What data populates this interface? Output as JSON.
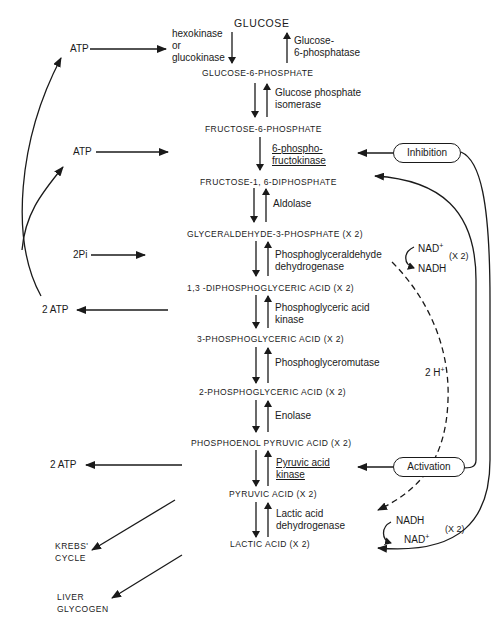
{
  "compounds": [
    {
      "id": "glucose",
      "label": "GLUCOSE"
    },
    {
      "id": "g6p",
      "label": "GLUCOSE-6-PHOSPHATE"
    },
    {
      "id": "f6p",
      "label": "FRUCTOSE-6-PHOSPHATE"
    },
    {
      "id": "f16dp",
      "label": "FRUCTOSE-1, 6-DIPHOSPHATE"
    },
    {
      "id": "g3p",
      "label": "GLYCERALDEHYDE-3-PHOSPHATE  (X 2)"
    },
    {
      "id": "dpga",
      "label": "1,3 -DIPHOSPHOGLYCERIC ACID   (X 2)"
    },
    {
      "id": "pga3",
      "label": "3-PHOSPHOGLYCERIC ACID  (X 2)"
    },
    {
      "id": "pga2",
      "label": "2-PHOSPHOGLYCERIC ACID    (X 2)"
    },
    {
      "id": "pep",
      "label": "PHOSPHOENOL PYRUVIC ACID    (X 2)"
    },
    {
      "id": "pyruvic",
      "label": "PYRUVIC ACID  (X 2)"
    },
    {
      "id": "lactic",
      "label": "LACTIC ACID    (X 2)"
    }
  ],
  "enzymes": {
    "hexokinase": [
      "hexokinase",
      "or",
      "glucokinase"
    ],
    "g6pase": [
      "Glucose-",
      "6-phosphatase"
    ],
    "gpi": [
      "Glucose phosphate",
      "isomerase"
    ],
    "pfk": [
      "6-phospho-",
      "fructokinase"
    ],
    "aldolase": [
      "Aldolase"
    ],
    "gapdh": [
      "Phosphoglyceraldehyde",
      "dehydrogenase"
    ],
    "pgk": [
      "Phosphoglyceric acid",
      "kinase"
    ],
    "pgm": [
      "Phosphoglyceromutase"
    ],
    "enolase": [
      "Enolase"
    ],
    "pk": [
      "Pyruvic acid",
      "kinase"
    ],
    "ldh": [
      "Lactic acid",
      "dehydrogenase"
    ]
  },
  "left_side": {
    "atp1": "ATP",
    "atp2": "ATP",
    "pi": "2Pi",
    "atp_out1": "2 ATP",
    "atp_out2": "2 ATP",
    "krebs": [
      "KREBS'",
      "CYCLE"
    ],
    "liver": [
      "LIVER",
      "GLYCOGEN"
    ]
  },
  "right_side": {
    "inhibition": "Inhibition",
    "activation": "Activation",
    "nad_top": "NAD",
    "nad_top_sup": "+",
    "nadh_top": "NADH",
    "x2_top": "(X 2)",
    "h2": "2 H",
    "h2_sup": "+",
    "nadh_bottom": "NADH",
    "nad_bottom": "NAD",
    "nad_bottom_sup": "+",
    "x2_bottom": "(X 2)"
  },
  "colors": {
    "ink": "#1a1a1a",
    "background": "#ffffff"
  }
}
